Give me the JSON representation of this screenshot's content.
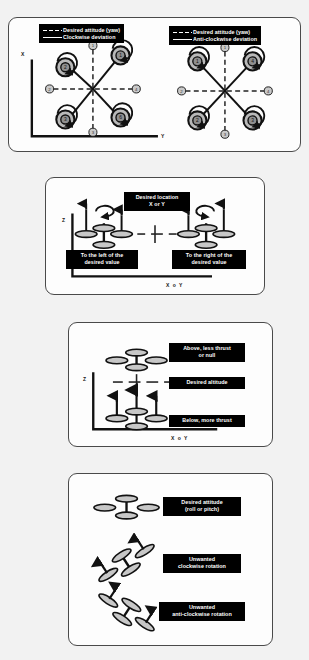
{
  "figure": {
    "background_color": "#f2f2f2",
    "panel_color": "#fdfdfd",
    "border_color": "#4a4a4a",
    "label_bg_color": "#000000",
    "label_text_color": "#ffffff"
  },
  "panel_yaw": {
    "left_legend": {
      "desired": "Desired attitude (yaw)",
      "deviation": "Clockwise deviation"
    },
    "right_legend": {
      "desired": "Desired attitude (yaw)",
      "deviation": "Anti-clockwise deviation"
    },
    "axis_x": "X",
    "axis_y": "Y",
    "left_rotor_labels": [
      "1",
      "2",
      "3",
      "4",
      "5",
      "6"
    ],
    "left_axis_markers": [
      "1",
      "2",
      "3",
      "4"
    ],
    "right_rotor_labels": [
      "1",
      "2",
      "3",
      "4",
      "5",
      "6"
    ],
    "right_axis_markers": [
      "1",
      "2",
      "3",
      "4"
    ]
  },
  "panel_position": {
    "axis_z": "Z",
    "axis_h": "X o Y",
    "desired": "Desired location\nX or Y",
    "left_of": "To the left of the\ndesired value",
    "right_of": "To the right of the\ndesired value"
  },
  "panel_altitude": {
    "axis_z": "Z",
    "axis_h": "X o Y",
    "above": "Above, less thrust\nor null",
    "desired": "Desired altitude",
    "below": "Below, more thrust"
  },
  "panel_attitude": {
    "desired": "Desired attitude\n(roll or pitch)",
    "clockwise": "Unwanted\nclockwise rotation",
    "anticlockwise": "Unwanted\nanti-clockwise rotation"
  }
}
